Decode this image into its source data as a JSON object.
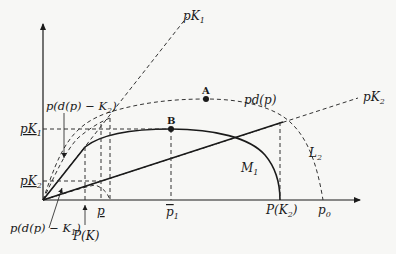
{
  "diagram": {
    "labels": {
      "pK1_line": "pK",
      "pK1_line_sub": "1",
      "pK2_line": "pK",
      "pK2_line_sub": "2",
      "pd": "pd(p)",
      "point_A": "A",
      "point_B": "B",
      "M1": "M",
      "M1_sub": "1",
      "L2": "L",
      "L2_sub": "2",
      "y_pK1": "pK",
      "y_pK1_sub": "1",
      "y_pK2": "pK",
      "y_pK2_sub": "2",
      "ann_top": "p(d(p) − K",
      "ann_top_sub": "2",
      "ann_top_close": ")",
      "ann_bottom": "p(d(p) − K",
      "ann_bottom_sub": "1",
      "ann_bottom_close": ")",
      "x_PK": "P(K)",
      "x_p_under": "p",
      "x_p1_bar": "p",
      "x_p1_sub": "1",
      "x_PK2": "P(K",
      "x_PK2_sub": "2",
      "x_PK2_close": ")",
      "x_p0": "p",
      "x_p0_sub": "0"
    }
  }
}
